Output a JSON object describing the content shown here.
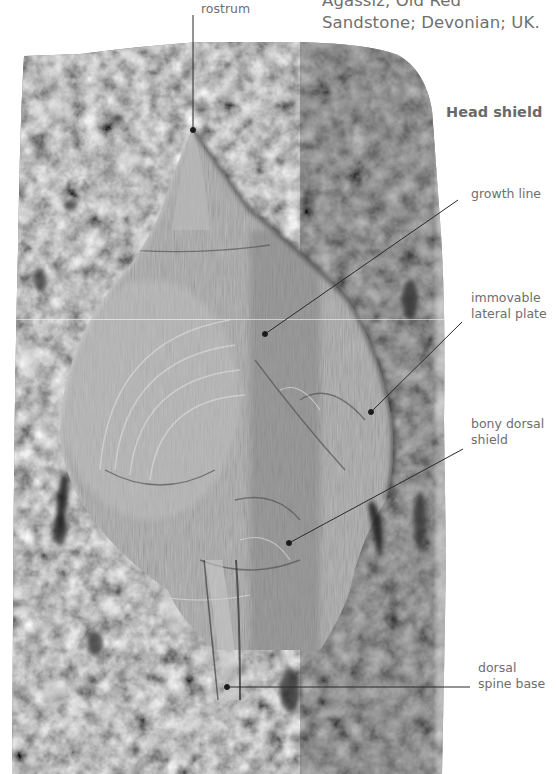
{
  "caption": {
    "line1": "Agassiz, Old Red",
    "line2": "Sandstone; Devonian; UK."
  },
  "section_heading": "Head shield",
  "labels": [
    {
      "id": "rostrum",
      "lines": [
        "rostrum"
      ]
    },
    {
      "id": "growth-line",
      "lines": [
        "growth line"
      ]
    },
    {
      "id": "immovable-lateral-plate",
      "lines": [
        "immovable",
        "lateral plate"
      ]
    },
    {
      "id": "bony-dorsal-shield",
      "lines": [
        "bony dorsal",
        "shield"
      ]
    },
    {
      "id": "dorsal-spine-base",
      "lines": [
        "dorsal",
        "spine base"
      ]
    }
  ],
  "image": {
    "subject": "fossil armoured fish head shield in rock slab",
    "colors": {
      "rock": "#6e6e6e",
      "fossil": "#a8a8a8",
      "leader": "#2a2a2a",
      "text": "#6e6e6e"
    }
  }
}
